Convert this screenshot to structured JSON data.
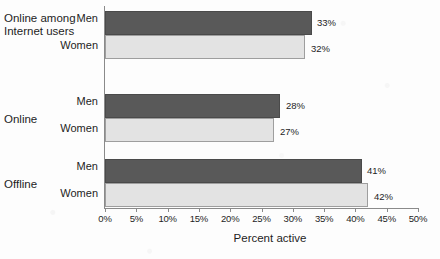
{
  "chart_data": {
    "type": "bar",
    "orientation": "horizontal",
    "title": "",
    "xlabel": "Percent active",
    "ylabel": "",
    "xlim": [
      0,
      50
    ],
    "xtick_labels": [
      "0%",
      "5%",
      "10%",
      "15%",
      "20%",
      "25%",
      "30%",
      "35%",
      "40%",
      "45%",
      "50%"
    ],
    "xtick_values": [
      0,
      5,
      10,
      15,
      20,
      25,
      30,
      35,
      40,
      45,
      50
    ],
    "grid": false,
    "legend": false,
    "categories": [
      "Online among Internet users",
      "Online",
      "Offline"
    ],
    "series": [
      {
        "name": "Men",
        "values": [
          33,
          28,
          41
        ],
        "color": "#595959"
      },
      {
        "name": "Women",
        "values": [
          32,
          27,
          42
        ],
        "color": "#e3e3e3"
      }
    ],
    "groups": [
      {
        "label_line1": "Online among",
        "label_line2": "Internet users",
        "bars": [
          {
            "series": "Men",
            "value": 33,
            "value_label": "33%"
          },
          {
            "series": "Women",
            "value": 32,
            "value_label": "32%"
          }
        ]
      },
      {
        "label_line1": "Online",
        "label_line2": "",
        "bars": [
          {
            "series": "Men",
            "value": 28,
            "value_label": "28%"
          },
          {
            "series": "Women",
            "value": 27,
            "value_label": "27%"
          }
        ]
      },
      {
        "label_line1": "Offline",
        "label_line2": "",
        "bars": [
          {
            "series": "Men",
            "value": 41,
            "value_label": "41%"
          },
          {
            "series": "Women",
            "value": 42,
            "value_label": "42%"
          }
        ]
      }
    ]
  },
  "axis": {
    "x_title": "Percent active",
    "ticks": [
      "0%",
      "5%",
      "10%",
      "15%",
      "20%",
      "25%",
      "30%",
      "35%",
      "40%",
      "45%",
      "50%"
    ]
  },
  "labels": {
    "group1_line1": "Online among",
    "group1_line2": "Internet users",
    "group2": "Online",
    "group3": "Offline",
    "men": "Men",
    "women": "Women"
  },
  "values": {
    "g1_men": "33%",
    "g1_women": "32%",
    "g2_men": "28%",
    "g2_women": "27%",
    "g3_men": "41%",
    "g3_women": "42%"
  },
  "colors": {
    "men_bar": "#595959",
    "women_bar": "#e3e3e3",
    "axis": "#8a8a8a",
    "text": "#1d1d1d",
    "background": "#fdfdfd"
  }
}
